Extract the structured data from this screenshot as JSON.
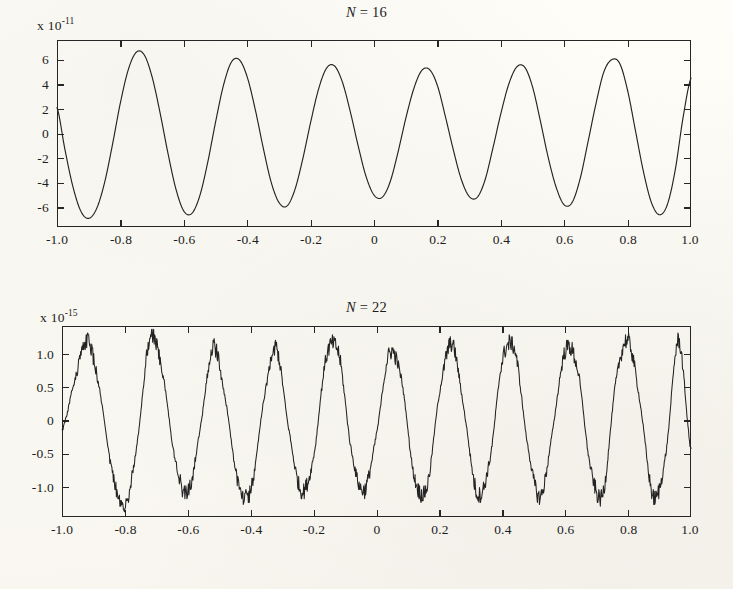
{
  "figure": {
    "background_color": "#fdfcf7",
    "ink_color": "#232323",
    "panels": [
      {
        "id": "top",
        "title": "N = 16",
        "title_var": "N",
        "title_rest": " = 16",
        "exponent_prefix": "x 10",
        "exponent_power": "-11",
        "y_ticks": [
          "6",
          "4",
          "2",
          "0",
          "-2",
          "-4",
          "-6"
        ],
        "x_ticks": [
          "-1.0",
          "-0.8",
          "-0.6",
          "-0.4",
          "-0.2",
          "0",
          "0.2",
          "0.4",
          "0.6",
          "0.8",
          "1.0"
        ]
      },
      {
        "id": "bottom",
        "title": "N = 22",
        "title_var": "N",
        "title_rest": " = 22",
        "exponent_prefix": "x 10",
        "exponent_power": "-15",
        "y_ticks": [
          "1.0",
          "0.5",
          "0",
          "-0.5",
          "-1.0"
        ],
        "x_ticks": [
          "-1.0",
          "-0.8",
          "-0.6",
          "-0.4",
          "-0.2",
          "0",
          "0.2",
          "0.4",
          "0.6",
          "0.8",
          "1.0"
        ]
      }
    ]
  },
  "chart_data": [
    {
      "type": "line",
      "title": "N = 16",
      "xlabel": "",
      "ylabel": "",
      "y_scale_factor": "1e-11",
      "y_scale_label": "x 10^-11",
      "xlim": [
        -1.0,
        1.0
      ],
      "ylim": [
        -7.6,
        7.6
      ],
      "xticks": [
        -1.0,
        -0.8,
        -0.6,
        -0.4,
        -0.2,
        0,
        0.2,
        0.4,
        0.6,
        0.8,
        1.0
      ],
      "xticklabels": [
        "-1.0",
        "-0.8",
        "-0.6",
        "-0.4",
        "-0.2",
        "0",
        "0.2",
        "0.4",
        "0.6",
        "0.8",
        "1.0"
      ],
      "yticks": [
        6,
        4,
        2,
        0,
        -2,
        -4,
        -6
      ],
      "yticklabels": [
        "6",
        "4",
        "2",
        "0",
        "-2",
        "-4",
        "-6"
      ],
      "grid": false,
      "legend": null,
      "series": [
        {
          "name": "evaluation error, N = 16",
          "description": "Smooth oscillatory roundoff-error curve, ~8.3 full cycles across x in [-1,1], amplitude envelope roughly 5.2 to 6.9 units of 1e-11, slightly larger near the interval endpoints.",
          "x": [
            -1.0,
            -0.975,
            -0.95,
            -0.925,
            -0.9,
            -0.875,
            -0.85,
            -0.825,
            -0.8,
            -0.775,
            -0.75,
            -0.725,
            -0.7,
            -0.675,
            -0.65,
            -0.625,
            -0.6,
            -0.575,
            -0.55,
            -0.525,
            -0.5,
            -0.475,
            -0.45,
            -0.425,
            -0.4,
            -0.375,
            -0.35,
            -0.325,
            -0.3,
            -0.275,
            -0.25,
            -0.225,
            -0.2,
            -0.175,
            -0.15,
            -0.125,
            -0.1,
            -0.075,
            -0.05,
            -0.025,
            0.0,
            0.025,
            0.05,
            0.075,
            0.1,
            0.125,
            0.15,
            0.175,
            0.2,
            0.225,
            0.25,
            0.275,
            0.3,
            0.325,
            0.35,
            0.375,
            0.4,
            0.425,
            0.45,
            0.475,
            0.5,
            0.525,
            0.55,
            0.575,
            0.6,
            0.625,
            0.65,
            0.675,
            0.7,
            0.725,
            0.75,
            0.775,
            0.8,
            0.825,
            0.85,
            0.875,
            0.9,
            0.925,
            0.95,
            0.975,
            1.0
          ],
          "y": [
            2.1,
            -1.3,
            -4.3,
            -6.3,
            -6.9,
            -6.1,
            -4.0,
            -0.9,
            2.5,
            5.2,
            6.6,
            6.4,
            4.6,
            1.7,
            -1.6,
            -4.5,
            -6.3,
            -6.5,
            -5.1,
            -2.4,
            0.9,
            3.9,
            5.8,
            6.0,
            4.6,
            2.0,
            -1.1,
            -3.9,
            -5.6,
            -5.9,
            -4.6,
            -2.1,
            0.9,
            3.6,
            5.3,
            5.5,
            4.2,
            1.8,
            -1.0,
            -3.5,
            -5.0,
            -5.2,
            -4.0,
            -1.6,
            1.2,
            3.6,
            5.1,
            5.2,
            3.9,
            1.4,
            -1.3,
            -3.7,
            -5.1,
            -5.2,
            -3.8,
            -1.2,
            1.6,
            4.0,
            5.4,
            5.4,
            3.8,
            1.0,
            -2.0,
            -4.4,
            -5.8,
            -5.6,
            -3.7,
            -0.7,
            2.4,
            5.0,
            6.0,
            5.7,
            3.5,
            0.2,
            -3.1,
            -5.6,
            -6.6,
            -5.8,
            -3.0,
            1.3,
            4.5
          ]
        }
      ]
    },
    {
      "type": "line",
      "title": "N = 22",
      "xlabel": "",
      "ylabel": "",
      "y_scale_factor": "1e-15",
      "y_scale_label": "x 10^-15",
      "xlim": [
        -1.0,
        1.0
      ],
      "ylim": [
        -1.45,
        1.42
      ],
      "xticks": [
        -1.0,
        -0.8,
        -0.6,
        -0.4,
        -0.2,
        0,
        0.2,
        0.4,
        0.6,
        0.8,
        1.0
      ],
      "xticklabels": [
        "-1.0",
        "-0.8",
        "-0.6",
        "-0.4",
        "-0.2",
        "0",
        "0.2",
        "0.4",
        "0.6",
        "0.8",
        "1.0"
      ],
      "yticks": [
        1.0,
        0.5,
        0,
        -0.5,
        -1.0
      ],
      "yticklabels": [
        "1.0",
        "0.5",
        "0",
        "-0.5",
        "-1.0"
      ],
      "grid": false,
      "legend": null,
      "series": [
        {
          "name": "evaluation error, N = 22",
          "description": "Noisy, quantized sawtooth-like oscillation with ~12 cycles across x in [-1,1]; amplitude about 1.05 to 1.25 units of 1e-15 with spiky machine-epsilon-level jitter at the peaks and troughs.",
          "x": [
            -1.0,
            -0.96,
            -0.92,
            -0.88,
            -0.84,
            -0.8,
            -0.76,
            -0.72,
            -0.68,
            -0.64,
            -0.6,
            -0.56,
            -0.52,
            -0.48,
            -0.44,
            -0.4,
            -0.36,
            -0.32,
            -0.28,
            -0.24,
            -0.2,
            -0.16,
            -0.12,
            -0.08,
            -0.04,
            0.0,
            0.04,
            0.08,
            0.12,
            0.16,
            0.2,
            0.24,
            0.28,
            0.32,
            0.36,
            0.4,
            0.44,
            0.48,
            0.52,
            0.56,
            0.6,
            0.64,
            0.68,
            0.72,
            0.76,
            0.8,
            0.84,
            0.88,
            0.92,
            0.96,
            1.0
          ],
          "y": [
            -0.15,
            0.6,
            1.2,
            0.45,
            -0.8,
            -1.3,
            -0.3,
            1.25,
            0.7,
            -0.6,
            -1.1,
            -0.1,
            1.1,
            0.3,
            -0.95,
            -1.05,
            0.25,
            1.1,
            -0.1,
            -1.05,
            -0.55,
            0.95,
            1.0,
            -0.45,
            -1.05,
            -0.2,
            1.0,
            0.6,
            -0.85,
            -1.0,
            0.4,
            1.15,
            0.1,
            -1.1,
            -0.6,
            0.9,
            1.05,
            -0.35,
            -1.15,
            -0.15,
            1.05,
            0.75,
            -0.7,
            -1.1,
            0.55,
            1.2,
            0.2,
            -1.15,
            -0.5,
            1.2,
            -0.45
          ]
        }
      ]
    }
  ]
}
